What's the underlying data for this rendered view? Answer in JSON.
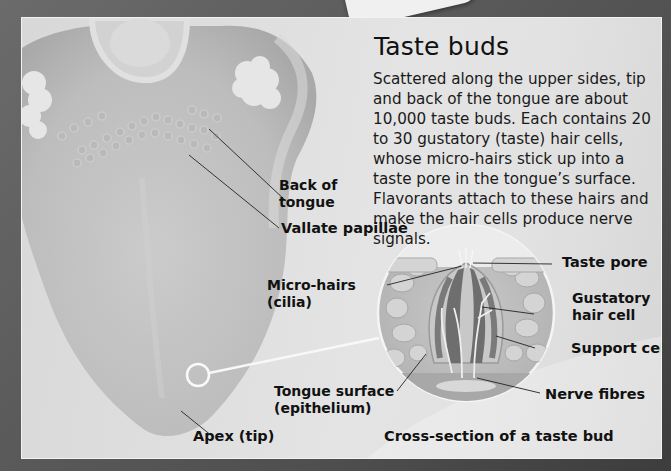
{
  "title": "Taste buds",
  "body_text": "Scattered along the upper sides, tip and back of the tongue are about 10,000 taste buds. Each contains 20 to 30 gustatory (taste) hair cells, whose micro-hairs stick up into a taste pore in the tongue’s surface. Flavorants attach to these hairs and make the hair cells produce nerve signals.",
  "tongue_labels": {
    "back_of_tongue": [
      "Back of",
      "tongue"
    ],
    "vallate_papillae": "Vallate papillae",
    "apex": "Apex (tip)"
  },
  "cross_section_labels": {
    "micro_hairs": [
      "Micro-hairs",
      "(cilia)"
    ],
    "taste_pore": "Taste pore",
    "gustatory_hair_cell": [
      "Gustatory",
      "hair cell"
    ],
    "support_cell": "Support cell",
    "nerve_fibres": "Nerve fibres",
    "tongue_surface": [
      "Tongue surface",
      "(epithelium)"
    ]
  },
  "caption": "Cross-section of a taste bud",
  "colors": {
    "frame": "#5a5a5a",
    "panel": "#e0e0e0",
    "tongue": "#c4c4c4",
    "text": "#111111"
  }
}
